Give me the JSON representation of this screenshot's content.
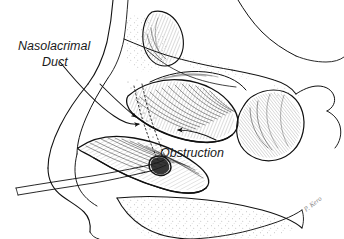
{
  "figure": {
    "title": "Nasolacrimal Duct Obstruction",
    "type": "anatomical-line-illustration",
    "view": "sagittal section of lateral nasal wall",
    "background_color": "#ffffff",
    "ink_color": "#111111",
    "width": 344,
    "height": 239
  },
  "labels": [
    {
      "id": "nasolacrimal-duct",
      "line1": "Nasolacrimal",
      "line2": "Duct",
      "x": 18,
      "y": 50,
      "align": "left",
      "leader": "curved arrow sweeping right and down to duct opening"
    },
    {
      "id": "obstruction",
      "line1": "Obstruction",
      "x": 160,
      "y": 157,
      "align": "left",
      "leader": "short arrow pointing up and left to blockage"
    }
  ],
  "signature": {
    "text": "P. Kero",
    "x": 306,
    "y": 212
  },
  "structures": [
    {
      "id": "frontal-sinus",
      "label": "frontal sinus"
    },
    {
      "id": "nasal-bone",
      "label": "nasal bone"
    },
    {
      "id": "superior-turbinate",
      "label": "superior turbinate"
    },
    {
      "id": "middle-turbinate",
      "label": "middle turbinate"
    },
    {
      "id": "inferior-turbinate",
      "label": "inferior turbinate"
    },
    {
      "id": "sphenoid-sinus",
      "label": "sphenoid sinus"
    },
    {
      "id": "hard-palate",
      "label": "hard palate"
    },
    {
      "id": "nasal-vestibule",
      "label": "nasal vestibule"
    },
    {
      "id": "nasolacrimal-duct-opening",
      "label": "nasolacrimal duct opening"
    },
    {
      "id": "nasal-septum-floor",
      "label": "nasal floor"
    }
  ]
}
